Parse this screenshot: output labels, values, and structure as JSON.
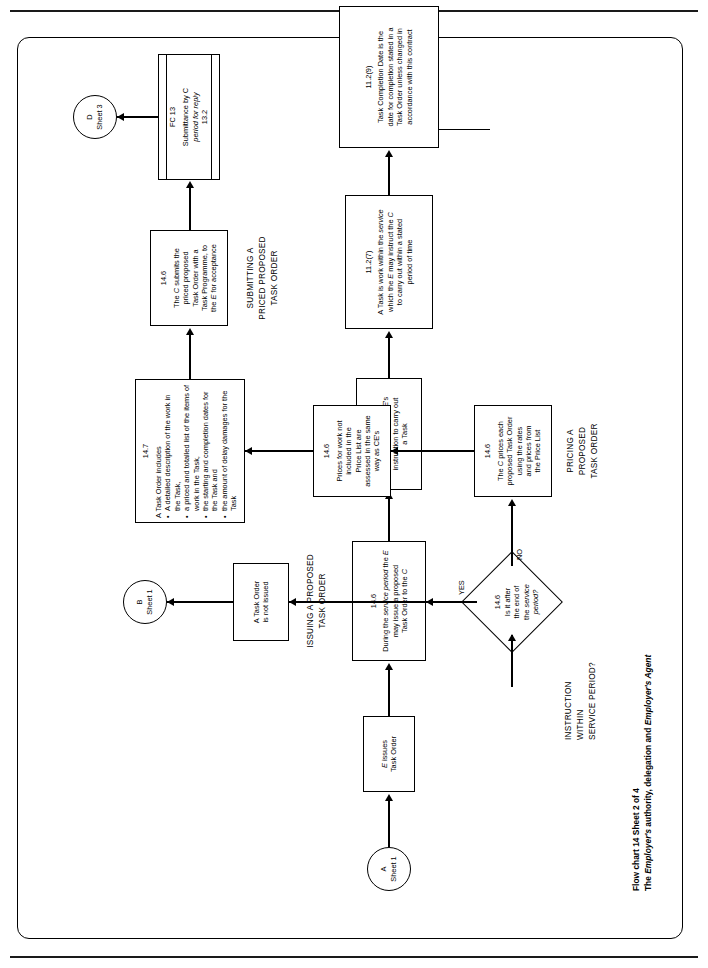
{
  "document": {
    "caption_line1": "Flow chart 14 Sheet 2 of 4",
    "caption_line2": "The Employer's authority, delegation and Employer's Agent"
  },
  "sections": {
    "issuing": "ISSUING A PROPOSED\nTASK ORDER",
    "instruction_within": "INSTRUCTION\nWITHIN\nSERVICE PERIOD?",
    "pricing": "PRICING A\nPROPOSED\nTASK ORDER",
    "submitting": "SUBMITTING A\nPRICED PROPOSED\nTASK ORDER"
  },
  "connectors": {
    "a": {
      "id": "A",
      "sheet": "Sheet 1"
    },
    "b": {
      "id": "B",
      "sheet": "Sheet 1"
    },
    "d": {
      "id": "D",
      "sheet": "Sheet 3"
    }
  },
  "nodes": {
    "e_issues": {
      "ref": "",
      "text": "E issues\nTask Order"
    },
    "cl_11_2_8": {
      "ref": "11.2(8)",
      "text": "A Task Order is the E's\ninstruction to carry out\na Task"
    },
    "cl_11_2_7": {
      "ref": "11.2(7)",
      "text": "A Task is work within the service\nwhich the E may instruct the C\nto carry out within a stated\nperiod of time"
    },
    "cl_11_2_9": {
      "ref": "11.2(9)",
      "text": "Task Completion Date is the\ndate for completion stated in a\nTask Order unless changed in\naccordance with this contract"
    },
    "cl_14_6_issue": {
      "ref": "14.6",
      "text": "During the service period the E\nmay issue a proposed\nTask Order to the C"
    },
    "decision": {
      "ref": "14.6",
      "text": "Is it after\nthe end of\nthe service\nperiod?",
      "yes_label": "YES",
      "no_label": "NO"
    },
    "not_issued": {
      "ref": "",
      "text": "A Task Order\nis not issued"
    },
    "cl_14_6_prices": {
      "ref": "14.6",
      "text": "The C prices each\nproposed Task Order\nusing the rates\nand prices from\nthe Price List"
    },
    "cl_14_6_notlisted": {
      "ref": "14.6",
      "text": "Prices for work not\nincluded in the\nPrice List are\nassessed in the same\nway as CE's"
    },
    "cl_14_7": {
      "ref": "14.7",
      "intro": "A Task Order includes",
      "bullets": [
        "A detailed description of the work in the Task,",
        "a priced and totalled list of the items of work in the Task,",
        "the starting and completion dates for the Task and",
        "the amount of delay damages for the Task"
      ]
    },
    "cl_14_6_submits": {
      "ref": "14.6",
      "text": "The C submits the\npriced proposed\nTask Order with a\nTask Programme, to\nthe E for acceptance"
    },
    "fc13": {
      "ref": "FC 13",
      "line1": "Submittance by C",
      "line2": "period for reply",
      "line3": "13.2"
    }
  }
}
